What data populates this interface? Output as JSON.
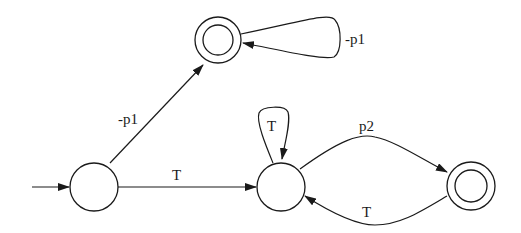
{
  "diagram": {
    "type": "finite-state-automaton",
    "colors": {
      "stroke": "#1a1a1a",
      "background": "#ffffff"
    },
    "nodes": [
      {
        "id": "s0",
        "initial": true,
        "accepting": false
      },
      {
        "id": "s1",
        "initial": false,
        "accepting": true
      },
      {
        "id": "s2",
        "initial": false,
        "accepting": false
      },
      {
        "id": "s3",
        "initial": false,
        "accepting": true
      }
    ],
    "edges": [
      {
        "from": "s0",
        "to": "s1",
        "label": "-p1"
      },
      {
        "from": "s1",
        "to": "s1",
        "label": "-p1"
      },
      {
        "from": "s0",
        "to": "s2",
        "label": "T"
      },
      {
        "from": "s2",
        "to": "s2",
        "label": "T"
      },
      {
        "from": "s2",
        "to": "s3",
        "label": "p2"
      },
      {
        "from": "s3",
        "to": "s2",
        "label": "T"
      }
    ]
  }
}
